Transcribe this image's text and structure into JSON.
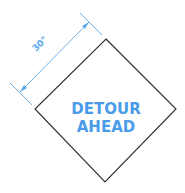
{
  "sign": {
    "line1": "DETOUR",
    "line2": "AHEAD",
    "text_color": "#4a9be8",
    "border_color": "#333333",
    "fill_color": "#ffffff"
  },
  "dimension": {
    "label": "30\"",
    "color": "#5aa8e8"
  }
}
